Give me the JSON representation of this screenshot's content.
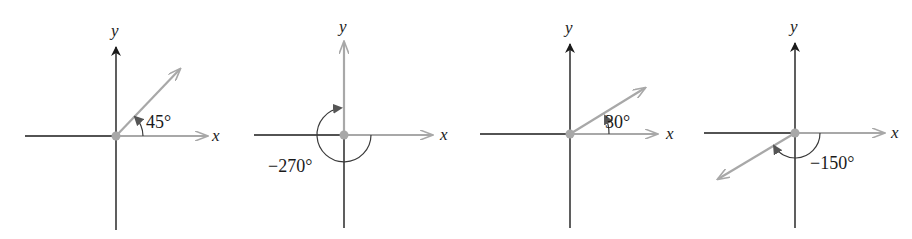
{
  "figure": {
    "colors": {
      "axis": "#1a1a1a",
      "terminal_side": "#a8a8a8",
      "vertex": "#a8a8a8",
      "arc": "#3a3a3a"
    },
    "diagrams": [
      {
        "x_label": "x",
        "y_label": "y",
        "angle_label": "45°",
        "angle_degrees": 45,
        "direction": "counterclockwise"
      },
      {
        "x_label": "x",
        "y_label": "y",
        "angle_label": "−270°",
        "angle_degrees": -270,
        "direction": "clockwise"
      },
      {
        "x_label": "x",
        "y_label": "y",
        "angle_label": "30°",
        "angle_degrees": 30,
        "direction": "counterclockwise"
      },
      {
        "x_label": "x",
        "y_label": "y",
        "angle_label": "−150°",
        "angle_degrees": -150,
        "direction": "clockwise"
      }
    ]
  }
}
